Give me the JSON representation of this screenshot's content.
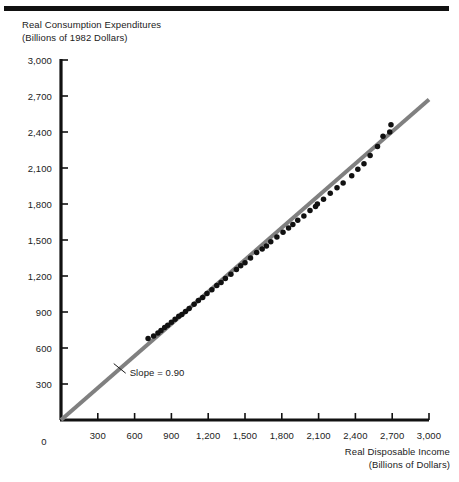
{
  "figure": {
    "top_rule": "decorative-rule",
    "y_axis_title_line1": "Real Consumption Expenditures",
    "y_axis_title_line2": "(Billions of 1982 Dollars)",
    "x_axis_title_line1": "Real Disposable Income",
    "x_axis_title_line2": "(Billions of Dollars)",
    "slope_annotation": "Slope = 0.90",
    "colors": {
      "line": "#808080",
      "points": "#111111",
      "axis": "#111111",
      "text": "#222222",
      "background": "#ffffff"
    }
  },
  "chart_data": {
    "type": "scatter",
    "title": "",
    "xlabel": "Real Disposable Income (Billions of Dollars)",
    "ylabel": "Real Consumption Expenditures (Billions of 1982 Dollars)",
    "xlim": [
      0,
      3000
    ],
    "ylim": [
      0,
      3000
    ],
    "grid": false,
    "legend": "none",
    "xticks": [
      0,
      300,
      600,
      900,
      1200,
      1500,
      1800,
      2100,
      2400,
      2700,
      3000
    ],
    "yticks": [
      0,
      300,
      600,
      900,
      1200,
      1500,
      1800,
      2100,
      2400,
      2700,
      3000
    ],
    "xtick_labels": [
      "0",
      "300",
      "600",
      "900",
      "1,200",
      "1,500",
      "1,800",
      "2,100",
      "2,400",
      "2,700",
      "3,000"
    ],
    "ytick_labels": [
      "0",
      "300",
      "600",
      "900",
      "1,200",
      "1,500",
      "1,800",
      "2,100",
      "2,400",
      "2,700",
      "3,000"
    ],
    "annotations": [
      {
        "text": "Slope = 0.90",
        "x": 560,
        "y": 390,
        "leader_from": [
          430,
          470
        ]
      }
    ],
    "fit_line": {
      "slope": 0.9,
      "intercept": 0,
      "x_start": 0,
      "x_end": 3000,
      "y_start": 0,
      "y_end": 2670,
      "color": "#808080",
      "width": 4
    },
    "series": [
      {
        "name": "Consumption vs Disposable Income",
        "marker": "circle",
        "marker_size": 5.5,
        "color": "#111111",
        "points": [
          [
            710,
            680
          ],
          [
            755,
            700
          ],
          [
            790,
            725
          ],
          [
            815,
            745
          ],
          [
            845,
            770
          ],
          [
            870,
            790
          ],
          [
            900,
            815
          ],
          [
            930,
            840
          ],
          [
            960,
            865
          ],
          [
            985,
            880
          ],
          [
            1015,
            905
          ],
          [
            1045,
            930
          ],
          [
            1085,
            965
          ],
          [
            1120,
            995
          ],
          [
            1155,
            1020
          ],
          [
            1190,
            1055
          ],
          [
            1230,
            1085
          ],
          [
            1270,
            1120
          ],
          [
            1305,
            1145
          ],
          [
            1340,
            1180
          ],
          [
            1385,
            1215
          ],
          [
            1430,
            1255
          ],
          [
            1465,
            1285
          ],
          [
            1500,
            1310
          ],
          [
            1545,
            1350
          ],
          [
            1595,
            1395
          ],
          [
            1640,
            1425
          ],
          [
            1675,
            1450
          ],
          [
            1710,
            1485
          ],
          [
            1760,
            1525
          ],
          [
            1810,
            1565
          ],
          [
            1855,
            1600
          ],
          [
            1890,
            1630
          ],
          [
            1930,
            1665
          ],
          [
            1980,
            1700
          ],
          [
            2030,
            1745
          ],
          [
            2075,
            1780
          ],
          [
            2090,
            1800
          ],
          [
            2140,
            1840
          ],
          [
            2195,
            1890
          ],
          [
            2250,
            1935
          ],
          [
            2300,
            1975
          ],
          [
            2370,
            2035
          ],
          [
            2420,
            2090
          ],
          [
            2470,
            2135
          ],
          [
            2520,
            2205
          ],
          [
            2580,
            2280
          ],
          [
            2625,
            2365
          ],
          [
            2680,
            2400
          ],
          [
            2690,
            2460
          ]
        ]
      }
    ]
  }
}
